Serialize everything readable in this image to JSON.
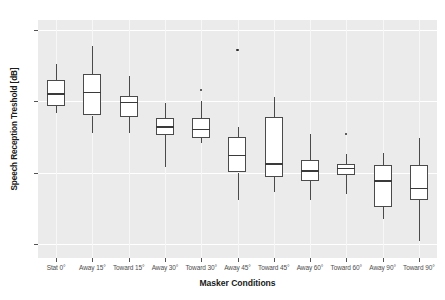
{
  "chart_data": {
    "type": "box",
    "title": "",
    "xlabel": "Masker Conditions",
    "ylabel": "Speech Reception Treshold [dB]",
    "ylim": [
      -26.0,
      -9.3
    ],
    "yticks": [
      -10,
      -15,
      -20,
      -25
    ],
    "ytick_labels": [
      "-10",
      "-15",
      "-20",
      "-25"
    ],
    "grid": "horizontal-major-white-on-gray",
    "legend": "none",
    "categories": [
      "Stat 0°",
      "Away 15°",
      "Toward 15°",
      "Away 30°",
      "Toward 30°",
      "Away 45°",
      "Toward 45°",
      "Away 60°",
      "Toward 60°",
      "Away 90°",
      "Toward 90°"
    ],
    "boxes": [
      {
        "category": "Stat 0°",
        "whisker_low": -15.8,
        "q1": -15.3,
        "median": -14.5,
        "q3": -13.5,
        "whisker_high": -12.4,
        "outliers": []
      },
      {
        "category": "Away 15°",
        "whisker_low": -17.2,
        "q1": -16.0,
        "median": -14.4,
        "q3": -13.1,
        "whisker_high": -11.1,
        "outliers": []
      },
      {
        "category": "Toward 15°",
        "whisker_low": -17.2,
        "q1": -16.1,
        "median": -15.1,
        "q3": -14.6,
        "whisker_high": -13.2,
        "outliers": []
      },
      {
        "category": "Away 30°",
        "whisker_low": -19.6,
        "q1": -17.4,
        "median": -16.8,
        "q3": -16.2,
        "whisker_high": -15.1,
        "outliers": []
      },
      {
        "category": "Toward 30°",
        "whisker_low": -17.9,
        "q1": -17.6,
        "median": -17.0,
        "q3": -16.2,
        "whisker_high": -15.0,
        "outliers": [
          -14.2
        ]
      },
      {
        "category": "Away 45°",
        "whisker_low": -21.9,
        "q1": -20.0,
        "median": -18.8,
        "q3": -17.5,
        "whisker_high": -16.8,
        "outliers": [
          -11.4
        ]
      },
      {
        "category": "Toward 45°",
        "whisker_low": -21.4,
        "q1": -20.3,
        "median": -19.4,
        "q3": -16.1,
        "whisker_high": -14.7,
        "outliers": []
      },
      {
        "category": "Away 60°",
        "whisker_low": -21.9,
        "q1": -20.6,
        "median": -19.9,
        "q3": -19.1,
        "whisker_high": -17.3,
        "outliers": []
      },
      {
        "category": "Toward 60°",
        "whisker_low": -21.5,
        "q1": -20.2,
        "median": -19.7,
        "q3": -19.4,
        "whisker_high": -18.7,
        "outliers": [
          -17.3
        ]
      },
      {
        "category": "Away 90°",
        "whisker_low": -23.3,
        "q1": -22.4,
        "median": -20.6,
        "q3": -19.5,
        "whisker_high": -18.6,
        "outliers": []
      },
      {
        "category": "Toward 90°",
        "whisker_low": -24.8,
        "q1": -21.9,
        "median": -21.1,
        "q3": -19.5,
        "whisker_high": -17.6,
        "outliers": []
      }
    ],
    "colors": {
      "panel_background": "#ebebeb",
      "gridline": "#ffffff",
      "box_fill": "#ffffff",
      "box_stroke": "#4a4a4a",
      "median": "#3a3a3a",
      "text": "#4d4d4d",
      "title_text": "#1a1a1a"
    }
  }
}
